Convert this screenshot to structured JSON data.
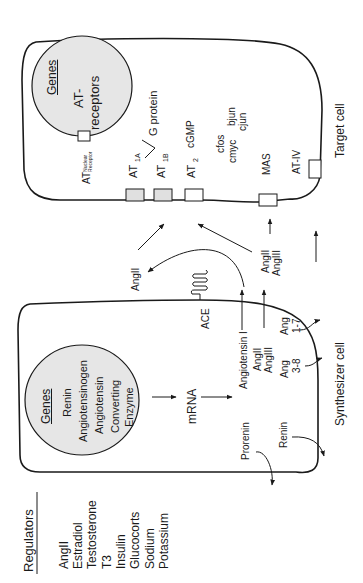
{
  "target_cell": {
    "label": "Target cell",
    "nucleus": {
      "title": "Genes",
      "line1": "AT-",
      "line2": "receptors"
    },
    "receptors": {
      "nuclear": {
        "main": "AT",
        "sub1": "Nuclear",
        "sub2": "Receptor"
      },
      "at1a": {
        "main": "AT",
        "sub": "1A"
      },
      "at1b": {
        "main": "AT",
        "sub": "1B"
      },
      "at2": {
        "main": "AT",
        "sub": "2"
      },
      "mas": "MAS",
      "at4": "AT-IV"
    },
    "g_protein": "G protein",
    "cgmp": "cGMP",
    "oncogenes": [
      "cfos",
      "cmyc",
      "bjun",
      "cjun"
    ]
  },
  "synthesizer_cell": {
    "label": "Synthesizer cell",
    "nucleus": {
      "title": "Genes",
      "items": [
        "Renin",
        "Angiotensinogen",
        "Angiotensin",
        "Converting",
        "Enzyme"
      ]
    },
    "mrna": "mRNA",
    "ace": "ACE",
    "angiotensin_i": "Angiotensin I",
    "products": {
      "angii": "AngII",
      "angiii": "AngIII",
      "ang38_a": "Ang",
      "ang38_b": "3-8",
      "ang17_a": "Ang",
      "ang17_b": "1-7"
    },
    "prorenin": "Prorenin",
    "renin": "Renin"
  },
  "extracellular": {
    "angii_loop": "AngII",
    "angii_pair_1": "AngII",
    "angii_pair_2": "AngIII"
  },
  "regulators": {
    "title": "Regulators",
    "items": [
      "AngII",
      "Estradiol",
      "Testosterone",
      "T3",
      "Insulin",
      "Glucocorts",
      "Sodium",
      "Potassium"
    ]
  },
  "colors": {
    "nucleus_fill": "#e6e6e6",
    "line": "#1a1a1a",
    "receptor_fill": "#e0e0e0"
  }
}
